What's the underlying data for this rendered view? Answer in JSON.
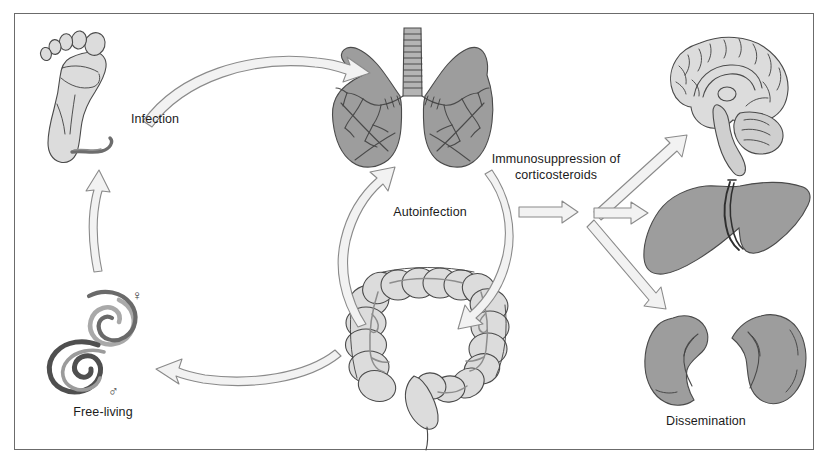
{
  "figure": {
    "background_color": "#ffffff",
    "border_color": "#6b6b6b",
    "width": 829,
    "height": 466
  },
  "palette": {
    "organ_dark_gray": "#9d9d9d",
    "organ_light_gray": "#dcdcdc",
    "organ_mid_gray": "#c6c6c6",
    "outline": "#4a4a4a",
    "arrow_fill": "#f2f2f2",
    "arrow_stroke": "#8a8a8a",
    "worm_dark": "#555555",
    "worm_light": "#a9a9a9",
    "text": "#1b1b1b"
  },
  "labels": {
    "infection": "Infection",
    "autoinfection": "Autoinfection",
    "free_living": "Free-living",
    "immunosuppression_line1": "Immunosuppression of",
    "immunosuppression_line2": "corticosteroids",
    "dissemination": "Dissemination",
    "female_symbol": "♀",
    "male_symbol": "♂"
  },
  "organs": [
    {
      "id": "foot",
      "name": "foot",
      "fill": "organ_light_gray",
      "position": "top-left"
    },
    {
      "id": "lungs",
      "name": "lungs",
      "fill": "organ_dark_gray",
      "position": "top-center"
    },
    {
      "id": "intestine",
      "name": "large-intestine",
      "fill": "organ_light_gray",
      "position": "bottom-center"
    },
    {
      "id": "worms",
      "name": "free-living-worms",
      "fill": "worm_dark",
      "position": "bottom-left"
    },
    {
      "id": "brain",
      "name": "brain",
      "fill": "organ_light_gray",
      "position": "top-right"
    },
    {
      "id": "liver",
      "name": "liver",
      "fill": "organ_dark_gray",
      "position": "middle-right"
    },
    {
      "id": "kidneys",
      "name": "kidneys",
      "fill": "organ_dark_gray",
      "position": "bottom-right"
    }
  ],
  "arrows": [
    {
      "id": "foot-to-lungs",
      "from": "foot",
      "to": "lungs",
      "style": "curved"
    },
    {
      "id": "lungs-to-intestine",
      "from": "lungs",
      "to": "intestine",
      "style": "curved-cycle-right"
    },
    {
      "id": "intestine-to-lungs",
      "from": "intestine",
      "to": "lungs",
      "style": "curved-cycle-left"
    },
    {
      "id": "intestine-to-worms",
      "from": "intestine",
      "to": "worms",
      "style": "curved"
    },
    {
      "id": "worms-to-foot",
      "from": "worms",
      "to": "foot",
      "style": "curved-up"
    },
    {
      "id": "intestine-to-branch",
      "from": "intestine",
      "to": "dissemination-hub",
      "style": "straight"
    },
    {
      "id": "branch-to-brain",
      "from": "dissemination-hub",
      "to": "brain",
      "style": "straight-diagonal-up"
    },
    {
      "id": "branch-to-liver",
      "from": "dissemination-hub",
      "to": "liver",
      "style": "straight"
    },
    {
      "id": "branch-to-kidneys",
      "from": "dissemination-hub",
      "to": "kidneys",
      "style": "straight-diagonal-down"
    }
  ]
}
